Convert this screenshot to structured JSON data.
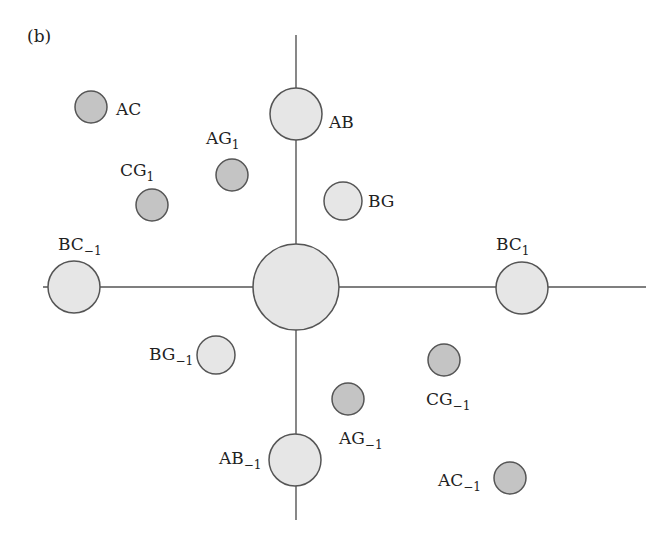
{
  "panel_label": "(b)",
  "colors": {
    "light_fill": "#e6e6e6",
    "dark_fill": "#c4c4c4",
    "stroke": "#555555",
    "text": "#222222"
  },
  "axes": {
    "vertical": {
      "x": 296,
      "y1": 35,
      "y2": 520
    },
    "horizontal": {
      "y": 287,
      "x1": 43,
      "x2": 646
    }
  },
  "nodes": [
    {
      "id": "center",
      "base": "",
      "sub": "",
      "cx": 296,
      "cy": 287,
      "r": 43,
      "shade": "light",
      "lx": 0,
      "ly": 0,
      "anchor": "start"
    },
    {
      "id": "AB",
      "base": "AB",
      "sub": "",
      "cx": 296,
      "cy": 114,
      "r": 26,
      "shade": "light",
      "lx": 329,
      "ly": 128,
      "anchor": "start"
    },
    {
      "id": "AB_-1",
      "base": "AB",
      "sub": "−1",
      "cx": 295,
      "cy": 460,
      "r": 26,
      "shade": "light",
      "lx": 219,
      "ly": 464,
      "anchor": "start"
    },
    {
      "id": "BC_-1",
      "base": "BC",
      "sub": "−1",
      "cx": 74,
      "cy": 287,
      "r": 26,
      "shade": "light",
      "lx": 58,
      "ly": 250,
      "anchor": "start"
    },
    {
      "id": "BC_1",
      "base": "BC",
      "sub": "1",
      "cx": 522,
      "cy": 288,
      "r": 26,
      "shade": "light",
      "lx": 496,
      "ly": 250,
      "anchor": "start"
    },
    {
      "id": "BG",
      "base": "BG",
      "sub": "",
      "cx": 343,
      "cy": 201,
      "r": 19,
      "shade": "light",
      "lx": 368,
      "ly": 207,
      "anchor": "start"
    },
    {
      "id": "BG_-1",
      "base": "BG",
      "sub": "−1",
      "cx": 216,
      "cy": 355,
      "r": 19,
      "shade": "light",
      "lx": 149,
      "ly": 360,
      "anchor": "start"
    },
    {
      "id": "AC",
      "base": "AC",
      "sub": "",
      "cx": 91,
      "cy": 107,
      "r": 16,
      "shade": "dark",
      "lx": 116,
      "ly": 115,
      "anchor": "start"
    },
    {
      "id": "AG_1",
      "base": "AG",
      "sub": "1",
      "cx": 232,
      "cy": 175,
      "r": 16,
      "shade": "dark",
      "lx": 206,
      "ly": 144,
      "anchor": "start"
    },
    {
      "id": "CG_1",
      "base": "CG",
      "sub": "1",
      "cx": 152,
      "cy": 205,
      "r": 16,
      "shade": "dark",
      "lx": 120,
      "ly": 176,
      "anchor": "start"
    },
    {
      "id": "CG_-1",
      "base": "CG",
      "sub": "−1",
      "cx": 444,
      "cy": 360,
      "r": 16,
      "shade": "dark",
      "lx": 426,
      "ly": 405,
      "anchor": "start"
    },
    {
      "id": "AG_-1",
      "base": "AG",
      "sub": "−1",
      "cx": 348,
      "cy": 399,
      "r": 16,
      "shade": "dark",
      "lx": 339,
      "ly": 444,
      "anchor": "start"
    },
    {
      "id": "AC_-1",
      "base": "AC",
      "sub": "−1",
      "cx": 510,
      "cy": 478,
      "r": 16,
      "shade": "dark",
      "lx": 438,
      "ly": 486,
      "anchor": "start"
    }
  ]
}
